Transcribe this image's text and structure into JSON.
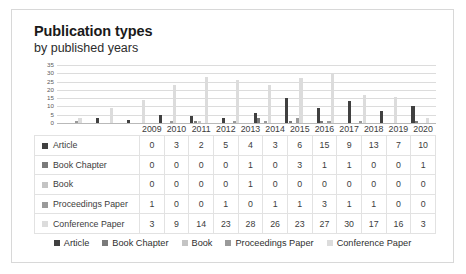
{
  "header": {
    "title": "Publication types",
    "subtitle": "by published years"
  },
  "colors": {
    "article": "#404040",
    "book_chapter": "#7a7a7a",
    "book": "#c4c4c4",
    "proceedings_paper": "#9a9a9a",
    "conference_paper": "#dcdcdc",
    "gridline": "#dcdcdc",
    "axis": "#b9b9b9",
    "card_border": "#d8d8d8"
  },
  "legend": {
    "items": [
      {
        "label": "Article",
        "color": "#404040"
      },
      {
        "label": "Book Chapter",
        "color": "#7a7a7a"
      },
      {
        "label": "Book",
        "color": "#c4c4c4"
      },
      {
        "label": "Proceedings Paper",
        "color": "#9a9a9a"
      },
      {
        "label": "Conference Paper",
        "color": "#dcdcdc"
      }
    ]
  },
  "chart_data": {
    "type": "bar",
    "title": "Publication types",
    "subtitle": "by published years",
    "xlabel": "",
    "ylabel": "",
    "ylim": [
      0,
      35
    ],
    "yticks": [
      35,
      30,
      25,
      20,
      15,
      10,
      5,
      0
    ],
    "grid": true,
    "legend_position": "bottom",
    "categories": [
      "2009",
      "2010",
      "2011",
      "2012",
      "2013",
      "2014",
      "2015",
      "2016",
      "2017",
      "2018",
      "2019",
      "2020"
    ],
    "series": [
      {
        "name": "Article",
        "color": "#404040",
        "values": [
          0,
          3,
          2,
          5,
          4,
          3,
          6,
          15,
          9,
          13,
          7,
          10
        ]
      },
      {
        "name": "Book Chapter",
        "color": "#7a7a7a",
        "values": [
          0,
          0,
          0,
          0,
          1,
          0,
          3,
          1,
          1,
          0,
          0,
          1
        ]
      },
      {
        "name": "Book",
        "color": "#c4c4c4",
        "values": [
          0,
          0,
          0,
          0,
          1,
          0,
          0,
          0,
          0,
          0,
          0,
          0
        ]
      },
      {
        "name": "Proceedings Paper",
        "color": "#9a9a9a",
        "values": [
          1,
          0,
          0,
          1,
          0,
          1,
          1,
          3,
          1,
          1,
          0,
          0
        ]
      },
      {
        "name": "Conference Paper",
        "color": "#dcdcdc",
        "values": [
          3,
          9,
          14,
          23,
          28,
          26,
          23,
          27,
          30,
          17,
          16,
          3
        ]
      }
    ]
  }
}
